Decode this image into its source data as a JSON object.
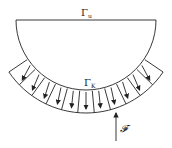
{
  "labels": {
    "gamma_u": "Γ",
    "gamma_u_sub": "u",
    "gamma_k": "Γ",
    "gamma_k_sub": "K",
    "force": "𝓕"
  },
  "geometry": {
    "center": [
      86,
      20
    ],
    "inner_radius": 71,
    "outer_radius": 93,
    "band_start_deg": 34,
    "band_end_deg": 146,
    "segments": 11
  },
  "colors": {
    "stroke": "#222222",
    "background": "#ffffff"
  }
}
